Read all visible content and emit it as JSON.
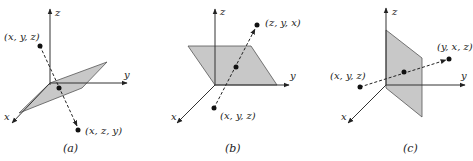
{
  "panels": [
    {
      "id": "a",
      "caption": "(a)",
      "axis_labels": {
        "x": "x",
        "y": "y",
        "z": "z"
      },
      "plane": "plane y = z (tilted)",
      "point_original": "(x, y, z)",
      "point_reflected": "(x, z, y)"
    },
    {
      "id": "b",
      "caption": "(b)",
      "axis_labels": {
        "x": "x",
        "y": "y",
        "z": "z"
      },
      "plane": "plane x = z",
      "point_original": "(x, y, z)",
      "point_reflected": "(z, y, x)"
    },
    {
      "id": "c",
      "caption": "(c)",
      "axis_labels": {
        "x": "x",
        "y": "y",
        "z": "z"
      },
      "plane": "plane x = y (vertical)",
      "point_original": "(x, y, z)",
      "point_reflected": "(y, x, z)"
    }
  ],
  "colors": {
    "plane_fill": "#c8c8c8",
    "axis": "#333333",
    "dot": "#111111"
  }
}
